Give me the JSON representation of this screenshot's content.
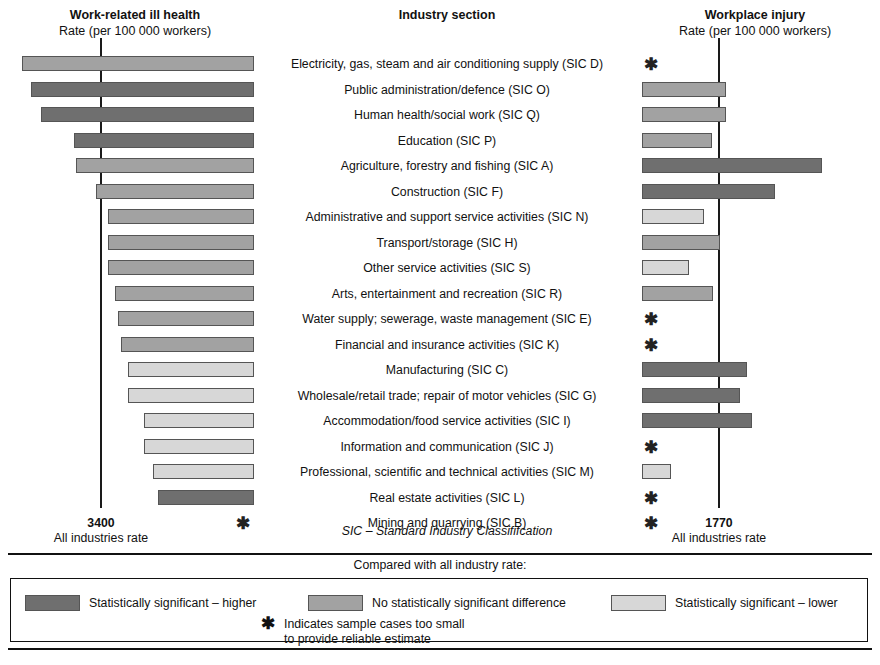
{
  "headers": {
    "left": {
      "title": "Work-related ill health",
      "subtitle": "Rate (per 100 000 workers)"
    },
    "middle": {
      "title": "Industry section"
    },
    "right": {
      "title": "Workplace injury",
      "subtitle": "Rate (per 100 000 workers)"
    }
  },
  "axis_footers": {
    "left": {
      "value": "3400",
      "caption": "All industries rate"
    },
    "right": {
      "value": "1770",
      "caption": "All industries rate"
    },
    "middle_note": "SIC – Standard Industry Classififcation"
  },
  "compare_note": "Compared with all industry rate:",
  "legend": {
    "items": [
      {
        "label": "Statistically significant – higher",
        "color": "#6f6f6f"
      },
      {
        "label": "No statistically significant difference",
        "color": "#a2a2a2"
      },
      {
        "label": "Statistically significant – lower",
        "color": "#d7d7d7"
      }
    ],
    "star_symbol": "✱",
    "star_line1": "Indicates sample cases too small",
    "star_line2": "to provide reliable estimate"
  },
  "colors": {
    "higher": "#6f6f6f",
    "same": "#a2a2a2",
    "lower": "#d7d7d7",
    "border": "#555555",
    "reference_line": "#1a1a1a"
  },
  "chart_data": {
    "type": "bar",
    "orientation": "horizontal-diverging-pair",
    "left_panel": {
      "title": "Work-related ill health",
      "unit": "Rate (per 100 000 workers)",
      "reference_value": 3400,
      "reference_label": "All industries rate"
    },
    "right_panel": {
      "title": "Workplace injury",
      "unit": "Rate (per 100 000 workers)",
      "reference_value": 1770,
      "reference_label": "All industries rate"
    },
    "categories": [
      "Electricity, gas, steam and air conditioning supply (SIC D)",
      "Public administration/defence (SIC O)",
      "Human health/social work (SIC Q)",
      "Education (SIC P)",
      "Agriculture, forestry and fishing (SIC A)",
      "Construction (SIC F)",
      "Administrative and support service activities (SIC N)",
      "Transport/storage (SIC H)",
      "Other service activities (SIC S)",
      "Arts, entertainment and recreation (SIC R)",
      "Water supply; sewerage, waste management (SIC E)",
      "Financial and insurance activities (SIC K)",
      "Manufacturing (SIC C)",
      "Wholesale/retail trade; repair of motor vehicles (SIC G)",
      "Accommodation/food service activities (SIC I)",
      "Information and communication (SIC J)",
      "Professional, scientific and technical activities (SIC M)",
      "Real estate activities (SIC L)",
      "Mining and quarrying (SIC B)"
    ],
    "rows": [
      {
        "label": "Electricity, gas, steam and air conditioning supply (SIC D)",
        "ill_health": {
          "bar_px": 232,
          "status": "same",
          "suppressed": false
        },
        "injury": {
          "bar_px": 0,
          "status": "none",
          "suppressed": true
        }
      },
      {
        "label": "Public administration/defence (SIC O)",
        "ill_health": {
          "bar_px": 223,
          "status": "higher",
          "suppressed": false
        },
        "injury": {
          "bar_px": 84,
          "status": "same",
          "suppressed": false
        }
      },
      {
        "label": "Human health/social work (SIC Q)",
        "ill_health": {
          "bar_px": 213,
          "status": "higher",
          "suppressed": false
        },
        "injury": {
          "bar_px": 84,
          "status": "same",
          "suppressed": false
        }
      },
      {
        "label": "Education (SIC P)",
        "ill_health": {
          "bar_px": 180,
          "status": "higher",
          "suppressed": false
        },
        "injury": {
          "bar_px": 70,
          "status": "same",
          "suppressed": false
        }
      },
      {
        "label": "Agriculture, forestry and fishing (SIC A)",
        "ill_health": {
          "bar_px": 178,
          "status": "same",
          "suppressed": false
        },
        "injury": {
          "bar_px": 180,
          "status": "higher",
          "suppressed": false
        }
      },
      {
        "label": "Construction (SIC F)",
        "ill_health": {
          "bar_px": 158,
          "status": "same",
          "suppressed": false
        },
        "injury": {
          "bar_px": 133,
          "status": "higher",
          "suppressed": false
        }
      },
      {
        "label": "Administrative and support service activities (SIC N)",
        "ill_health": {
          "bar_px": 146,
          "status": "same",
          "suppressed": false
        },
        "injury": {
          "bar_px": 62,
          "status": "lower",
          "suppressed": false
        }
      },
      {
        "label": "Transport/storage (SIC H)",
        "ill_health": {
          "bar_px": 146,
          "status": "same",
          "suppressed": false
        },
        "injury": {
          "bar_px": 78,
          "status": "same",
          "suppressed": false
        }
      },
      {
        "label": "Other service activities (SIC S)",
        "ill_health": {
          "bar_px": 146,
          "status": "same",
          "suppressed": false
        },
        "injury": {
          "bar_px": 47,
          "status": "lower",
          "suppressed": false
        }
      },
      {
        "label": "Arts, entertainment and recreation (SIC R)",
        "ill_health": {
          "bar_px": 139,
          "status": "same",
          "suppressed": false
        },
        "injury": {
          "bar_px": 71,
          "status": "same",
          "suppressed": false
        }
      },
      {
        "label": "Water supply; sewerage, waste management (SIC E)",
        "ill_health": {
          "bar_px": 136,
          "status": "same",
          "suppressed": false
        },
        "injury": {
          "bar_px": 0,
          "status": "none",
          "suppressed": true
        }
      },
      {
        "label": "Financial and insurance activities (SIC K)",
        "ill_health": {
          "bar_px": 133,
          "status": "same",
          "suppressed": false
        },
        "injury": {
          "bar_px": 0,
          "status": "none",
          "suppressed": true
        }
      },
      {
        "label": "Manufacturing (SIC C)",
        "ill_health": {
          "bar_px": 126,
          "status": "lower",
          "suppressed": false
        },
        "injury": {
          "bar_px": 105,
          "status": "higher",
          "suppressed": false
        }
      },
      {
        "label": "Wholesale/retail trade; repair of motor vehicles (SIC G)",
        "ill_health": {
          "bar_px": 126,
          "status": "lower",
          "suppressed": false
        },
        "injury": {
          "bar_px": 98,
          "status": "higher",
          "suppressed": false
        }
      },
      {
        "label": "Accommodation/food service activities (SIC I)",
        "ill_health": {
          "bar_px": 110,
          "status": "lower",
          "suppressed": false
        },
        "injury": {
          "bar_px": 110,
          "status": "higher",
          "suppressed": false
        }
      },
      {
        "label": "Information and communication (SIC J)",
        "ill_health": {
          "bar_px": 110,
          "status": "lower",
          "suppressed": false
        },
        "injury": {
          "bar_px": 0,
          "status": "none",
          "suppressed": true
        }
      },
      {
        "label": "Professional, scientific and technical activities (SIC M)",
        "ill_health": {
          "bar_px": 101,
          "status": "lower",
          "suppressed": false
        },
        "injury": {
          "bar_px": 29,
          "status": "lower",
          "suppressed": false
        }
      },
      {
        "label": "Real estate activities (SIC L)",
        "ill_health": {
          "bar_px": 96,
          "status": "higher",
          "suppressed": false
        },
        "injury": {
          "bar_px": 0,
          "status": "none",
          "suppressed": true
        }
      },
      {
        "label": "Mining and quarrying (SIC B)",
        "ill_health": {
          "bar_px": 0,
          "status": "none",
          "suppressed": true
        },
        "injury": {
          "bar_px": 0,
          "status": "none",
          "suppressed": true
        }
      }
    ],
    "notes": [
      "Asterisk indicates sample cases too small to provide reliable estimate",
      "Bar shading encodes statistical comparison with the all-industry rate"
    ]
  }
}
